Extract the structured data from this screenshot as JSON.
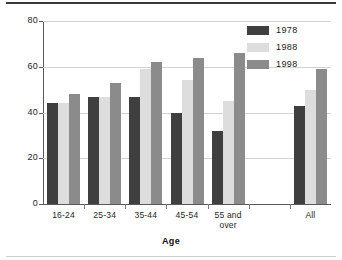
{
  "chart_data": {
    "type": "bar",
    "title": "",
    "xlabel": "Age",
    "ylabel": "Percentage",
    "categories": [
      "16-24",
      "25-34",
      "35-44",
      "45-54",
      "55 and\nover",
      "All"
    ],
    "series": [
      {
        "name": "1978",
        "color": "#3f3f3f",
        "values": [
          44,
          47,
          47,
          40,
          32,
          43
        ]
      },
      {
        "name": "1988",
        "color": "#dddddd",
        "values": [
          44,
          47,
          59,
          54,
          45,
          50
        ]
      },
      {
        "name": "1998",
        "color": "#8b8b8b",
        "values": [
          48,
          53,
          62,
          64,
          66,
          59
        ]
      }
    ],
    "ylim": [
      0,
      80
    ],
    "yticks": [
      0,
      20,
      40,
      60,
      80
    ],
    "ytick_labels": [
      "0",
      "20",
      "40",
      "60",
      "80"
    ],
    "grid": true,
    "legend_position": "top-right"
  },
  "axis": {
    "y_title": "Percentage",
    "x_title": "Age"
  }
}
